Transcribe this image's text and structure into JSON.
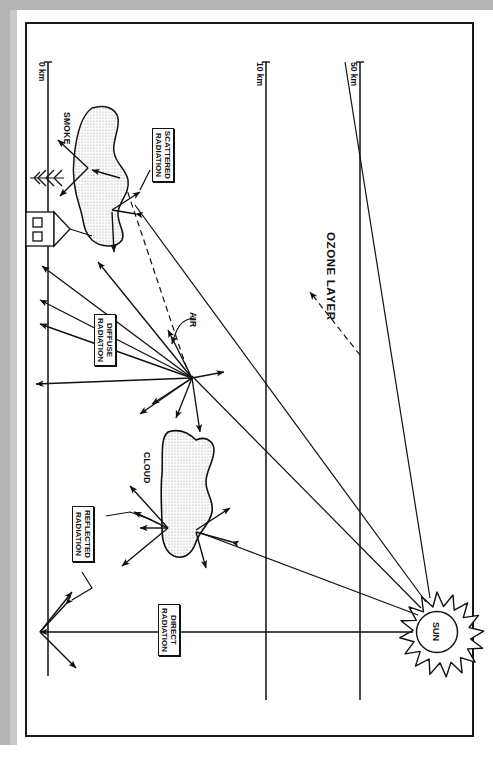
{
  "document": {
    "kind": "scanned-figure",
    "title": "Solar radiation through the atmosphere",
    "orientation": "rotated-90-clockwise"
  },
  "colors": {
    "ink": "#1a1a1a",
    "paper": "#ffffff",
    "scan_edge": "#b4b4b4",
    "scan_edge_soft": "#c8c8c8",
    "stipple": "#9a9a9a"
  },
  "altitude_axis": {
    "ticks": [
      {
        "label": "0 km",
        "id": "tick-0km"
      },
      {
        "label": "10 km",
        "id": "tick-10km"
      },
      {
        "label": "50 km",
        "id": "tick-50km"
      }
    ]
  },
  "layers": {
    "ozone_label": "OZONE LAYER"
  },
  "features": {
    "smoke_label": "SMOKE",
    "cloud_label": "CLOUD",
    "air_label": "AIR",
    "sun_label": "SUN"
  },
  "radiation_boxes": [
    {
      "id": "scattered",
      "line1": "SCATTERED",
      "line2": "RADIATION"
    },
    {
      "id": "diffuse",
      "line1": "DIFFUSE",
      "line2": "RADIATION"
    },
    {
      "id": "reflected",
      "line1": "REFLECTED",
      "line2": "RADIATION"
    },
    {
      "id": "direct",
      "line1": "DIRECT",
      "line2": "RADIATION"
    }
  ]
}
